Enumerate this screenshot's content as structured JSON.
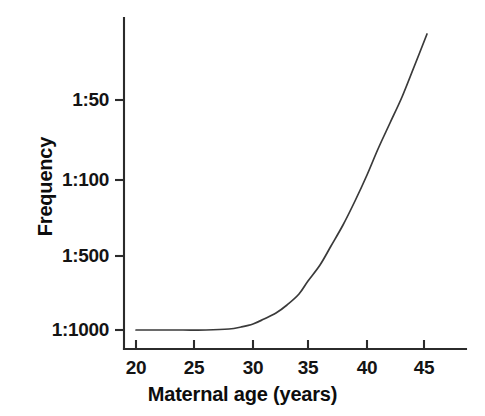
{
  "chart_data": {
    "type": "line",
    "title": "",
    "xlabel": "Maternal age (years)",
    "ylabel": "Frequency",
    "grid": false,
    "legend": null,
    "x_ticks": [
      {
        "label": "20",
        "value": 20,
        "px": 136
      },
      {
        "label": "25",
        "value": 25,
        "px": 194
      },
      {
        "label": "30",
        "value": 30,
        "px": 253
      },
      {
        "label": "35",
        "value": 35,
        "px": 308
      },
      {
        "label": "40",
        "value": 40,
        "px": 367
      },
      {
        "label": "45",
        "value": 45,
        "px": 424
      }
    ],
    "y_ticks": [
      {
        "label": "1:50",
        "value": 0.02,
        "px": 100
      },
      {
        "label": "1:100",
        "value": 0.01,
        "px": 180
      },
      {
        "label": "1:500",
        "value": 0.002,
        "px": 256
      },
      {
        "label": "1:1000",
        "value": 0.001,
        "px": 330
      }
    ],
    "xlim": [
      19,
      47
    ],
    "ylim_labels": [
      "1:1000",
      "1:50"
    ],
    "y_scale": "reciprocal-log",
    "series": [
      {
        "name": "Down syndrome frequency by maternal age",
        "x": [
          20,
          22,
          24,
          26,
          28,
          29,
          30,
          31,
          32,
          33,
          34,
          35,
          36,
          37,
          38,
          39,
          40,
          41,
          42,
          43,
          44,
          45.2
        ],
        "y_labels": [
          "1:1000",
          "1:1000",
          "1:1000",
          "1:1000",
          "1:1000",
          "1:980",
          "1:940",
          "1:880",
          "1:800",
          "1:720",
          "1:620",
          "1:520",
          "1:430",
          "1:340",
          "1:260",
          "1:190",
          "1:140",
          "1:100",
          "1:72",
          "1:52",
          "1:38",
          "1:28"
        ],
        "points_px": [
          [
            136,
            330
          ],
          [
            159,
            330
          ],
          [
            183,
            330
          ],
          [
            206,
            330
          ],
          [
            229,
            329
          ],
          [
            241,
            327
          ],
          [
            253,
            324
          ],
          [
            264,
            319
          ],
          [
            276,
            313
          ],
          [
            287,
            305
          ],
          [
            299,
            294
          ],
          [
            308,
            281
          ],
          [
            320,
            265
          ],
          [
            331,
            246
          ],
          [
            343,
            225
          ],
          [
            355,
            201
          ],
          [
            367,
            175
          ],
          [
            378,
            149
          ],
          [
            390,
            123
          ],
          [
            402,
            97
          ],
          [
            414,
            67
          ],
          [
            427,
            34
          ]
        ]
      }
    ],
    "axis_geometry": {
      "y_axis_x": 124,
      "y_axis_top": 18,
      "x_axis_y": 349,
      "x_axis_right": 466,
      "tick_length": 9
    },
    "colors": {
      "curve": "#3a3a3a",
      "axis": "#2b2b2b",
      "text": "#141414",
      "background": "#ffffff"
    }
  }
}
